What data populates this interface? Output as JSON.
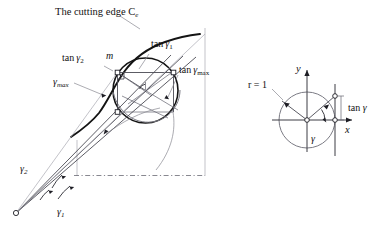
{
  "figure": {
    "title_caption": "The cutting edge C",
    "title_caption_sub": "e",
    "background_color": "#ffffff",
    "ink_color": "#141414",
    "accent_gray": "#7b7b84"
  },
  "left_diagram": {
    "name": "cutting-edge-construction",
    "labels": {
      "cutting_edge": "The cutting edge C",
      "cutting_edge_sub": "e",
      "point_m": "m",
      "tan_gamma_1": "tan",
      "tan_gamma_1_sym": "γ",
      "tan_gamma_1_sub": "1",
      "tan_gamma_2": "tan",
      "tan_gamma_2_sym": "γ",
      "tan_gamma_2_sub": "2",
      "tan_gamma_max": "tan",
      "tan_gamma_max_sym": "γ",
      "tan_gamma_max_sub": "max",
      "gamma_max_sym": "γ",
      "gamma_max_sub": "max",
      "gamma_1_sym": "γ",
      "gamma_1_sub": "1",
      "gamma_2_sym": "γ",
      "gamma_2_sub": "2"
    }
  },
  "right_diagram": {
    "name": "unit-circle-tangent-definition",
    "labels": {
      "radius": "r = 1",
      "axis_x": "x",
      "axis_y": "y",
      "tan_gamma": "tan",
      "tan_gamma_sym": "γ",
      "angle_gamma": "γ"
    },
    "geometry": {
      "radius_value": 1,
      "center_x": 307,
      "center_y": 120,
      "radius_px": 28
    }
  }
}
